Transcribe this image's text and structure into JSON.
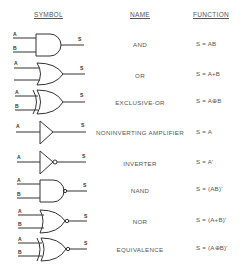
{
  "headers": {
    "symbol": "SYMBOL",
    "name": "NAME",
    "function": "FUNCTION"
  },
  "pin_labels": {
    "a": "A",
    "b": "B",
    "s": "S"
  },
  "colors": {
    "line": "#333333",
    "text": "#555555",
    "background": "#ffffff"
  },
  "rows": [
    {
      "gate": "and-gate-icon",
      "name": "AND",
      "function": "S = AB"
    },
    {
      "gate": "or-gate-icon",
      "name": "OR",
      "function": "S = A+B"
    },
    {
      "gate": "xor-gate-icon",
      "name": "EXCLUSIVE-OR",
      "function": "S = A⊕B"
    },
    {
      "gate": "buffer-gate-icon",
      "name": "NONINVERTING AMPLIFIER",
      "function": "S = A"
    },
    {
      "gate": "inverter-gate-icon",
      "name": "INVERTER",
      "function": "S = A'"
    },
    {
      "gate": "nand-gate-icon",
      "name": "NAND",
      "function": "S = (AB)'"
    },
    {
      "gate": "nor-gate-icon",
      "name": "NOR",
      "function": "S = (A+B)'"
    },
    {
      "gate": "xnor-gate-icon",
      "name": "EQUIVALENCE",
      "function": "S = (A⊕B)'"
    }
  ]
}
